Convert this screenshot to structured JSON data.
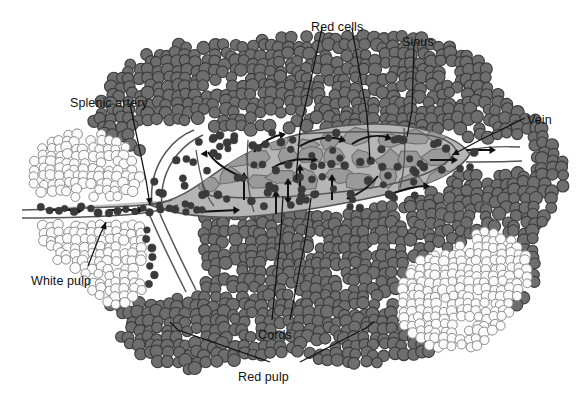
{
  "figure": {
    "type": "anatomical-diagram",
    "background_color": "#ffffff"
  },
  "colors": {
    "red_cell_fill": "#6e6e6e",
    "red_cell_stroke": "#3b3b3b",
    "white_cell_fill": "#fbfbfb",
    "white_cell_stroke": "#8c8c8c",
    "sinus_fill": "#b5b5b5",
    "sinus_stroke": "#555555",
    "cord_fill": "#9a9a9a",
    "cord_stroke": "#6f6f6f",
    "dot_fill": "#3a3a3a",
    "leader_line": "#111111",
    "label_text": "#111111"
  },
  "labels": [
    {
      "id": "splenic-artery",
      "text": "Splenic artery",
      "x": 70,
      "y": 96,
      "anchor": "start"
    },
    {
      "id": "red-cells",
      "text": "Red cells",
      "x": 311,
      "y": 20,
      "anchor": "start"
    },
    {
      "id": "sinus",
      "text": "Sinus",
      "x": 402,
      "y": 35,
      "anchor": "start"
    },
    {
      "id": "vein",
      "text": "Vein",
      "x": 527,
      "y": 113,
      "anchor": "start"
    },
    {
      "id": "white-pulp",
      "text": "White pulp",
      "x": 31,
      "y": 274,
      "anchor": "start"
    },
    {
      "id": "cords",
      "text": "Cords",
      "x": 258,
      "y": 328,
      "anchor": "start"
    },
    {
      "id": "red-pulp",
      "text": "Red pulp",
      "x": 238,
      "y": 370,
      "anchor": "start"
    }
  ],
  "leaders": [
    {
      "for": "splenic-artery",
      "points": "130,104 146,180 150,205"
    },
    {
      "for": "red-cells",
      "points": "322,28 300,130 296,180"
    },
    {
      "for": "red-cells-2",
      "points": "352,28 367,115 370,160"
    },
    {
      "for": "sinus",
      "points": "414,44 412,110 407,137"
    },
    {
      "for": "vein",
      "points": "525,118 480,140 452,155"
    },
    {
      "for": "white-pulp",
      "points": "88,266 100,235 106,222"
    },
    {
      "for": "cords",
      "points": "272,320 281,230 283,196"
    },
    {
      "for": "cords-2",
      "points": "290,320 306,235 311,198"
    },
    {
      "for": "red-pulp",
      "points": "270,362 178,330 170,322"
    },
    {
      "for": "red-pulp-2",
      "points": "300,362 366,328 374,322"
    }
  ],
  "regions": {
    "red_pulp": {
      "name": "Red pulp",
      "description": "Dense mass of dark grey red blood cells surrounding the sinus"
    },
    "white_pulp_left": {
      "name": "White pulp",
      "description": "Cluster of pale outlined lymphocytes at lower left"
    },
    "white_pulp_right": {
      "name": "White pulp",
      "description": "Cluster of pale outlined lymphocytes at lower right"
    },
    "sinus": {
      "name": "Sinus",
      "description": "Central elongated vascular channel running left to right"
    },
    "cords": {
      "name": "Cords",
      "description": "Irregular reticular cord tissue inside the sinus region"
    },
    "splenic_artery": {
      "name": "Splenic artery",
      "description": "Vessel entering from the left with an upward branch"
    },
    "vein": {
      "name": "Vein",
      "description": "Vessel exiting at the right side"
    }
  }
}
